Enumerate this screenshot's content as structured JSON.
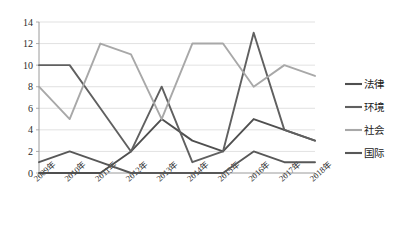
{
  "chart_data": {
    "type": "line",
    "title": "",
    "xlabel": "",
    "ylabel": "",
    "categories": [
      "2009年",
      "2010年",
      "2011年",
      "2012年",
      "2013年",
      "2014年",
      "2015年",
      "2016年",
      "2017年",
      "2018年"
    ],
    "ylim": [
      0,
      14
    ],
    "ytick_step": 2,
    "yticks": [
      0,
      2,
      4,
      6,
      8,
      10,
      12,
      14
    ],
    "grid": true,
    "legend_position": "right",
    "series": [
      {
        "name": "法律",
        "color": "#4f4f4f",
        "values": [
          0,
          0,
          0,
          2,
          5,
          3,
          2,
          5,
          4,
          3
        ]
      },
      {
        "name": "环境",
        "color": "#606060",
        "values": [
          10,
          10,
          6,
          2,
          8,
          1,
          2,
          13,
          4,
          3
        ]
      },
      {
        "name": "社会",
        "color": "#a8a8a8",
        "values": [
          8,
          5,
          12,
          11,
          5,
          12,
          12,
          8,
          10,
          9
        ]
      },
      {
        "name": "国际",
        "color": "#585858",
        "values": [
          1,
          2,
          1,
          0,
          0,
          0,
          0,
          2,
          1,
          1
        ]
      }
    ]
  },
  "legend": {
    "entries": [
      {
        "label": "法律"
      },
      {
        "label": "环境"
      },
      {
        "label": "社会"
      },
      {
        "label": "国际"
      }
    ]
  },
  "axis": {
    "y_tick_labels": [
      "14",
      "12",
      "10",
      "8",
      "6",
      "4",
      "2",
      "0"
    ],
    "x_tick_labels": [
      "2009年",
      "2010年",
      "2011年",
      "2012年",
      "2013年",
      "2014年",
      "2015年",
      "2016年",
      "2017年",
      "2018年"
    ]
  }
}
